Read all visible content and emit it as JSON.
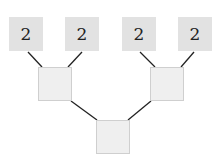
{
  "tree": {
    "leaves": [
      {
        "label": "2"
      },
      {
        "label": "2"
      },
      {
        "label": "2"
      },
      {
        "label": "2"
      }
    ],
    "level1": [
      {
        "label": ""
      },
      {
        "label": ""
      }
    ],
    "root": {
      "label": ""
    },
    "colors": {
      "leaf_fill": "#e2e2e2",
      "inner_fill": "#efefef",
      "edge": "#222222"
    }
  }
}
